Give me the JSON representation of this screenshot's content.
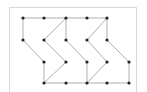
{
  "diagram": {
    "type": "graph",
    "edge_color": "#b0b0b0",
    "node_color": "#222222",
    "frame_color": "#d8d8d8",
    "nodes": [
      {
        "id": "r0c0",
        "x": 23,
        "y": 18
      },
      {
        "id": "r0c1",
        "x": 44,
        "y": 18
      },
      {
        "id": "r0c2",
        "x": 66,
        "y": 18
      },
      {
        "id": "r0c3",
        "x": 87,
        "y": 18
      },
      {
        "id": "r0c4",
        "x": 107,
        "y": 18
      },
      {
        "id": "r1c0",
        "x": 23,
        "y": 40
      },
      {
        "id": "r1c1",
        "x": 44,
        "y": 40
      },
      {
        "id": "r1c2",
        "x": 66,
        "y": 40
      },
      {
        "id": "r1c3",
        "x": 87,
        "y": 40
      },
      {
        "id": "r1c4",
        "x": 107,
        "y": 40
      },
      {
        "id": "r2c1",
        "x": 44,
        "y": 62
      },
      {
        "id": "r2c2",
        "x": 66,
        "y": 62
      },
      {
        "id": "r2c3",
        "x": 87,
        "y": 62
      },
      {
        "id": "r2c4",
        "x": 107,
        "y": 62
      },
      {
        "id": "r2c5",
        "x": 129,
        "y": 62
      },
      {
        "id": "r3c1",
        "x": 44,
        "y": 83
      },
      {
        "id": "r3c2",
        "x": 66,
        "y": 83
      },
      {
        "id": "r3c3",
        "x": 87,
        "y": 83
      },
      {
        "id": "r3c4",
        "x": 107,
        "y": 83
      },
      {
        "id": "r3c5",
        "x": 129,
        "y": 83
      }
    ],
    "edges": [
      [
        "r0c0",
        "r0c1"
      ],
      [
        "r0c1",
        "r0c2"
      ],
      [
        "r0c2",
        "r0c3"
      ],
      [
        "r0c3",
        "r0c4"
      ],
      [
        "r0c0",
        "r1c0"
      ],
      [
        "r1c0",
        "r2c1"
      ],
      [
        "r2c1",
        "r3c1"
      ],
      [
        "r0c2",
        "r1c1"
      ],
      [
        "r1c1",
        "r2c2"
      ],
      [
        "r2c2",
        "r3c1"
      ],
      [
        "r0c2",
        "r1c2"
      ],
      [
        "r1c2",
        "r2c3"
      ],
      [
        "r2c3",
        "r3c3"
      ],
      [
        "r0c4",
        "r1c3"
      ],
      [
        "r1c3",
        "r2c4"
      ],
      [
        "r2c4",
        "r3c3"
      ],
      [
        "r0c4",
        "r1c4"
      ],
      [
        "r1c4",
        "r2c5"
      ],
      [
        "r2c5",
        "r3c5"
      ],
      [
        "r3c1",
        "r3c2"
      ],
      [
        "r3c2",
        "r3c3"
      ],
      [
        "r3c3",
        "r3c4"
      ],
      [
        "r3c4",
        "r3c5"
      ]
    ]
  }
}
